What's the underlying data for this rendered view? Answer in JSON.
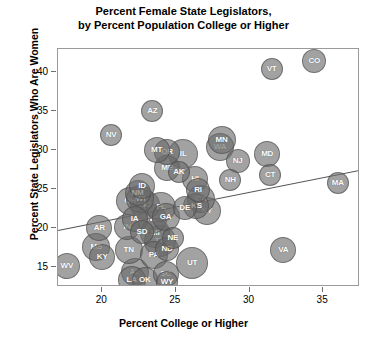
{
  "chart_data": {
    "type": "scatter",
    "title": "Percent Female State Legislators, by Percent Population College or Higher",
    "title_line1": "Percent Female State Legislators,",
    "title_line2": "by Percent Population College or Higher",
    "xlabel": "Percent College or Higher",
    "ylabel": "Percent State Legislators Who Are Women",
    "xlim": [
      17,
      37.5
    ],
    "ylim": [
      12.5,
      43
    ],
    "xticks": [
      20,
      25,
      30,
      35
    ],
    "yticks": [
      15,
      20,
      25,
      30,
      35,
      40
    ],
    "grid": false,
    "legend": null,
    "marker": "bubble",
    "bubble_color": "#696969",
    "trendline": {
      "x0": 17,
      "y0": 19.8,
      "x1": 37.5,
      "y1": 27.5,
      "color": "#555555"
    },
    "points": [
      {
        "label": "WV",
        "x": 17.6,
        "y": 15.2,
        "r": 13
      },
      {
        "label": "MS",
        "x": 19.6,
        "y": 17.6,
        "r": 14
      },
      {
        "label": "KY",
        "x": 20.0,
        "y": 16.4,
        "r": 13
      },
      {
        "label": "AR",
        "x": 19.8,
        "y": 20.0,
        "r": 13
      },
      {
        "label": "NV",
        "x": 20.6,
        "y": 32.0,
        "r": 11
      },
      {
        "label": "AL",
        "x": 22.2,
        "y": 14.4,
        "r": 14
      },
      {
        "label": "LA",
        "x": 22.0,
        "y": 13.4,
        "r": 14
      },
      {
        "label": "OK",
        "x": 22.9,
        "y": 13.4,
        "r": 13
      },
      {
        "label": "SC",
        "x": 24.3,
        "y": 14.2,
        "r": 13
      },
      {
        "label": "WY",
        "x": 24.4,
        "y": 13.2,
        "r": 11
      },
      {
        "label": "TN",
        "x": 21.8,
        "y": 17.2,
        "r": 14
      },
      {
        "label": "IN",
        "x": 21.7,
        "y": 20.2,
        "r": 13
      },
      {
        "label": "PA",
        "x": 23.5,
        "y": 16.6,
        "r": 14
      },
      {
        "label": "TX",
        "x": 23.9,
        "y": 18.4,
        "r": 16
      },
      {
        "label": "ND",
        "x": 24.4,
        "y": 17.4,
        "r": 12
      },
      {
        "label": "NE",
        "x": 24.8,
        "y": 18.8,
        "r": 11
      },
      {
        "label": "MI",
        "x": 23.6,
        "y": 19.4,
        "r": 15
      },
      {
        "label": "SD",
        "x": 22.7,
        "y": 19.5,
        "r": 12
      },
      {
        "label": "UT",
        "x": 26.1,
        "y": 15.6,
        "r": 16
      },
      {
        "label": "IA",
        "x": 22.2,
        "y": 21.2,
        "r": 13
      },
      {
        "label": "NC",
        "x": 23.4,
        "y": 21.2,
        "r": 15
      },
      {
        "label": "GA",
        "x": 24.3,
        "y": 21.5,
        "r": 14
      },
      {
        "label": "MO",
        "x": 22.9,
        "y": 23.0,
        "r": 15
      },
      {
        "label": "FL",
        "x": 24.0,
        "y": 22.8,
        "r": 15
      },
      {
        "label": "OH",
        "x": 21.9,
        "y": 23.5,
        "r": 14
      },
      {
        "label": "WI",
        "x": 22.6,
        "y": 23.8,
        "r": 14
      },
      {
        "label": "NM",
        "x": 22.4,
        "y": 24.6,
        "r": 13
      },
      {
        "label": "ID",
        "x": 22.7,
        "y": 25.5,
        "r": 13
      },
      {
        "label": "DE",
        "x": 25.6,
        "y": 22.6,
        "r": 12
      },
      {
        "label": "KS",
        "x": 26.4,
        "y": 22.9,
        "r": 13
      },
      {
        "label": "NY",
        "x": 27.1,
        "y": 22.2,
        "r": 14
      },
      {
        "label": "CA",
        "x": 26.7,
        "y": 23.8,
        "r": 14
      },
      {
        "label": "RI",
        "x": 26.5,
        "y": 24.9,
        "r": 12
      },
      {
        "label": "HI",
        "x": 26.3,
        "y": 26.4,
        "r": 13
      },
      {
        "label": "NH",
        "x": 28.7,
        "y": 26.2,
        "r": 11
      },
      {
        "label": "MA",
        "x": 36.0,
        "y": 25.8,
        "r": 11
      },
      {
        "label": "VA",
        "x": 32.3,
        "y": 17.2,
        "r": 13
      },
      {
        "label": "CT",
        "x": 31.4,
        "y": 26.9,
        "r": 11
      },
      {
        "label": "MD",
        "x": 31.2,
        "y": 29.6,
        "r": 13
      },
      {
        "label": "NJ",
        "x": 29.2,
        "y": 28.6,
        "r": 12
      },
      {
        "label": "AK",
        "x": 25.2,
        "y": 27.2,
        "r": 11
      },
      {
        "label": "ME",
        "x": 24.4,
        "y": 27.7,
        "r": 13
      },
      {
        "label": "IL",
        "x": 25.5,
        "y": 29.6,
        "r": 15
      },
      {
        "label": "OR",
        "x": 24.4,
        "y": 29.8,
        "r": 13
      },
      {
        "label": "MT",
        "x": 23.7,
        "y": 30.0,
        "r": 13
      },
      {
        "label": "WA",
        "x": 28.0,
        "y": 30.4,
        "r": 14
      },
      {
        "label": "MN",
        "x": 28.1,
        "y": 31.4,
        "r": 14
      },
      {
        "label": "AZ",
        "x": 23.4,
        "y": 35.0,
        "r": 11
      },
      {
        "label": "VT",
        "x": 31.5,
        "y": 40.4,
        "r": 11
      },
      {
        "label": "CO",
        "x": 34.4,
        "y": 41.4,
        "r": 12
      }
    ]
  }
}
